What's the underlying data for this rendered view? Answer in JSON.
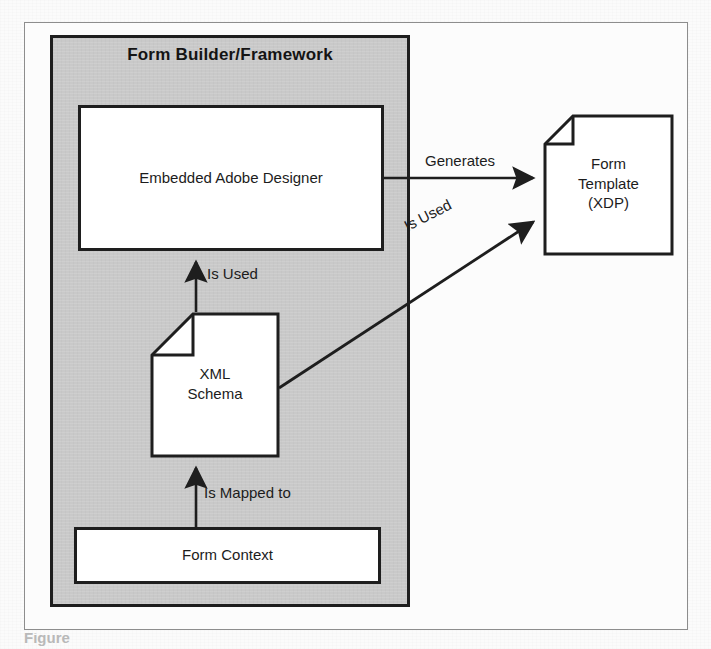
{
  "diagram": {
    "container": {
      "title": "Form Builder/Framework",
      "fill_color": "#c9c9c9",
      "border_color": "#1e1e1e"
    },
    "nodes": [
      {
        "id": "embedded-adobe-designer",
        "shape": "rectangle",
        "label": "Embedded Adobe Designer"
      },
      {
        "id": "xml-schema",
        "shape": "document",
        "label": "XML\nSchema"
      },
      {
        "id": "form-context",
        "shape": "rectangle",
        "label": "Form Context"
      },
      {
        "id": "form-template",
        "shape": "document",
        "label": "Form\nTemplate\n(XDP)"
      }
    ],
    "edges": [
      {
        "id": "designer-to-template",
        "from": "embedded-adobe-designer",
        "to": "form-template",
        "label": "Generates",
        "direction": "right"
      },
      {
        "id": "schema-to-designer",
        "from": "xml-schema",
        "to": "embedded-adobe-designer",
        "label": "Is Used",
        "direction": "up"
      },
      {
        "id": "schema-to-template",
        "from": "xml-schema",
        "to": "form-template",
        "label": "Is Used",
        "direction": "diagonal-up-right"
      },
      {
        "id": "context-to-schema",
        "from": "form-context",
        "to": "xml-schema",
        "label": "Is Mapped to",
        "direction": "up"
      }
    ]
  },
  "caption": {
    "partial_text": "Figure"
  }
}
